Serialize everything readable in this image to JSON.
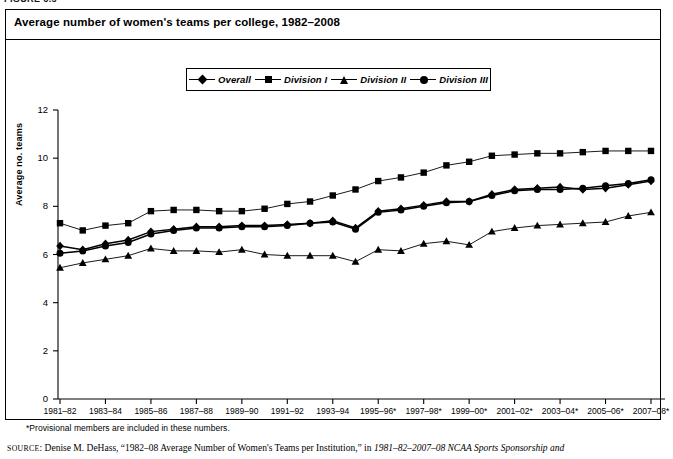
{
  "figure": {
    "label": "FIGURE 6.5",
    "title": "Average number of women's teams per college, 1982–2008"
  },
  "legend": {
    "position": "top-center",
    "items": [
      {
        "label": "Overall",
        "marker": "diamond-marker-icon"
      },
      {
        "label": "Division I",
        "marker": "square-marker-icon"
      },
      {
        "label": "Division II",
        "marker": "triangle-marker-icon"
      },
      {
        "label": "Division III",
        "marker": "circle-marker-icon"
      }
    ]
  },
  "axes": {
    "ylabel": "Average no. teams",
    "yticks": [
      "0",
      "2",
      "4",
      "6",
      "8",
      "10",
      "12"
    ],
    "xticks": [
      "1981–82",
      "1983–84",
      "1985–86",
      "1987–88",
      "1989–90",
      "1991–92",
      "1993–94",
      "1995–96*",
      "1997–98*",
      "1999–00*",
      "2001–02*",
      "2003–04*",
      "2005–06*",
      "2007–08*"
    ]
  },
  "footnote": "*Provisional members are included in these numbers.",
  "source": {
    "prefix": "SOURCE",
    "text": ": Denise M. DeHass, “1982–08 Average Number of Women's Teams per Institution,” in ",
    "italic": "1981–82–2007–08 NCAA Sports Sponsorship and"
  },
  "colors": {
    "line": "#000000",
    "axis": "#000000",
    "background": "#ffffff"
  },
  "chart_data": {
    "type": "line",
    "title": "Average number of women's teams per college, 1982–2008",
    "xlabel": "",
    "ylabel": "Average no. teams",
    "ylim": [
      0,
      12
    ],
    "grid": false,
    "legend_position": "top-center",
    "x": [
      "1981–82",
      "1982–83",
      "1983–84",
      "1984–85",
      "1985–86",
      "1986–87",
      "1987–88",
      "1988–89",
      "1989–90",
      "1990–91",
      "1991–92",
      "1992–93",
      "1993–94",
      "1994–95",
      "1995–96*",
      "1996–97*",
      "1997–98*",
      "1998–99*",
      "1999–00*",
      "2000–01*",
      "2001–02*",
      "2002–03*",
      "2003–04*",
      "2004–05*",
      "2005–06*",
      "2006–07*",
      "2007–08*"
    ],
    "series": [
      {
        "name": "Overall",
        "marker": "diamond",
        "values": [
          6.35,
          6.2,
          6.45,
          6.6,
          6.95,
          7.05,
          7.15,
          7.15,
          7.2,
          7.2,
          7.25,
          7.3,
          7.4,
          7.1,
          7.8,
          7.9,
          8.05,
          8.2,
          8.2,
          8.5,
          8.7,
          8.75,
          8.8,
          8.7,
          8.75,
          8.9,
          9.05
        ]
      },
      {
        "name": "Division I",
        "marker": "square",
        "values": [
          7.3,
          7.0,
          7.2,
          7.3,
          7.8,
          7.85,
          7.85,
          7.8,
          7.8,
          7.9,
          8.1,
          8.2,
          8.45,
          8.7,
          9.05,
          9.2,
          9.4,
          9.7,
          9.85,
          10.1,
          10.15,
          10.2,
          10.2,
          10.25,
          10.3,
          10.3,
          10.3
        ]
      },
      {
        "name": "Division II",
        "marker": "triangle",
        "values": [
          5.45,
          5.65,
          5.8,
          5.95,
          6.25,
          6.15,
          6.15,
          6.1,
          6.2,
          6.0,
          5.95,
          5.95,
          5.95,
          5.7,
          6.2,
          6.15,
          6.45,
          6.55,
          6.4,
          6.95,
          7.1,
          7.2,
          7.25,
          7.3,
          7.35,
          7.6,
          7.75
        ]
      },
      {
        "name": "Division III",
        "marker": "circle",
        "values": [
          6.05,
          6.15,
          6.35,
          6.5,
          6.85,
          7.0,
          7.1,
          7.1,
          7.15,
          7.15,
          7.2,
          7.3,
          7.35,
          7.05,
          7.75,
          7.85,
          8.0,
          8.15,
          8.2,
          8.45,
          8.65,
          8.7,
          8.7,
          8.75,
          8.85,
          8.95,
          9.1
        ]
      }
    ]
  }
}
